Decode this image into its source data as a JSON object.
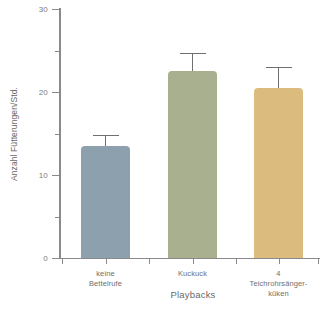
{
  "chart_data": {
    "type": "bar",
    "title": "",
    "xlabel": "Playbacks",
    "ylabel": "Anzahl Fütterungen/Std.",
    "categories": [
      "keine\nBettelrufe",
      "Kuckuck",
      "4 Teichrohrsänger-\nküken"
    ],
    "values": [
      13.5,
      22.5,
      20.5
    ],
    "errors": [
      1.3,
      2.2,
      2.5
    ],
    "ylim": [
      0,
      30
    ],
    "yticks": [
      0,
      10,
      20,
      30
    ],
    "ytick_labels": [
      "0",
      "10",
      "20",
      "30"
    ],
    "yminorticks": [
      5,
      15,
      25
    ],
    "grid": false,
    "legend": "none",
    "bar_colors": [
      "#8ca0ad",
      "#a8b08f",
      "#dcbc7e"
    ],
    "axis_color": "#8a8a8a",
    "error_bar_color": "#6f6f6f",
    "background": "#ffffff"
  }
}
